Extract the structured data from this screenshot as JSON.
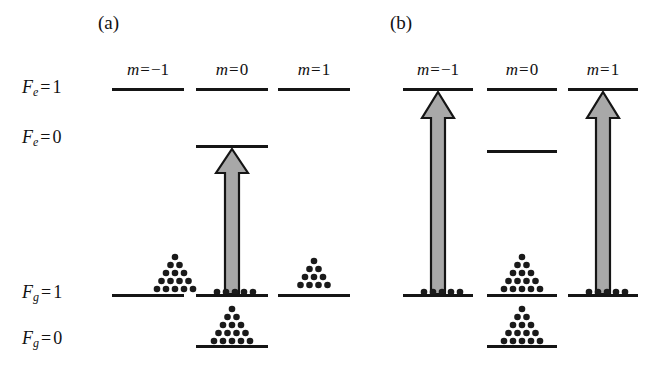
{
  "figure": {
    "width": 666,
    "height": 376,
    "background": "#ffffff",
    "line_color": "#151515",
    "arrow_fill": "#a8a8a8",
    "arrow_stroke": "#151515",
    "dot_color": "#1a1a1a"
  },
  "panels": [
    {
      "id": "a",
      "caption": "(a)",
      "caption_x": 98,
      "caption_y": 12,
      "f_labels": [
        {
          "key": "Fe1",
          "F": "F",
          "sub": "e",
          "eq": "=",
          "num": "1",
          "text": "F_e = 1",
          "x": 22,
          "y": 77
        },
        {
          "key": "Fe0",
          "F": "F",
          "sub": "e",
          "eq": "=",
          "num": "0",
          "text": "F_e = 0",
          "x": 22,
          "y": 127
        },
        {
          "key": "Fg1",
          "F": "F",
          "sub": "g",
          "eq": "=",
          "num": "1",
          "text": "F_g = 1",
          "x": 22,
          "y": 282
        },
        {
          "key": "Fg0",
          "F": "F",
          "sub": "g",
          "eq": "=",
          "num": "0",
          "text": "F_g = 0",
          "x": 22,
          "y": 328
        }
      ],
      "m_labels": [
        {
          "text": "m = -1",
          "m": "m",
          "eq": "=",
          "num": "−1",
          "x": 112,
          "y": 60,
          "width": 72
        },
        {
          "text": "m = 0",
          "m": "m",
          "eq": "=",
          "num": "0",
          "x": 196,
          "y": 60,
          "width": 72
        },
        {
          "text": "m = 1",
          "m": "m",
          "eq": "=",
          "num": "1",
          "x": 278,
          "y": 60,
          "width": 72
        }
      ],
      "levels": [
        {
          "name": "Fe1-m-1",
          "x": 112,
          "y": 88,
          "w": 72
        },
        {
          "name": "Fe1-m0",
          "x": 196,
          "y": 88,
          "w": 72
        },
        {
          "name": "Fe1-m1",
          "x": 278,
          "y": 88,
          "w": 72
        },
        {
          "name": "Fe0-m0",
          "x": 196,
          "y": 145,
          "w": 72
        },
        {
          "name": "Fg1-m-1",
          "x": 112,
          "y": 294,
          "w": 72
        },
        {
          "name": "Fg1-m0",
          "x": 196,
          "y": 294,
          "w": 72
        },
        {
          "name": "Fg1-m1",
          "x": 278,
          "y": 294,
          "w": 72
        },
        {
          "name": "Fg0-m0",
          "x": 196,
          "y": 345,
          "w": 72
        }
      ],
      "arrows": [
        {
          "name": "excitation-arrow-m0",
          "x": 214,
          "y": 147,
          "w": 36,
          "h": 148
        }
      ],
      "dot_clusters": [
        {
          "name": "atom-population-Fg1-m-1",
          "type": "pyramid",
          "rows": 5,
          "x": 148,
          "y": 253
        },
        {
          "name": "atom-population-Fg1-m0",
          "type": "single-row",
          "count": 6,
          "x": 232,
          "y": 287
        },
        {
          "name": "atom-population-Fg1-m1",
          "type": "pyramid",
          "rows": 5,
          "x": 314,
          "y": 257
        },
        {
          "name": "atom-population-Fg0-m0",
          "type": "pyramid",
          "rows": 5,
          "x": 232,
          "y": 305
        }
      ]
    },
    {
      "id": "b",
      "caption": "(b)",
      "caption_x": 390,
      "caption_y": 12,
      "f_labels": [],
      "m_labels": [
        {
          "text": "m = -1",
          "m": "m",
          "eq": "=",
          "num": "−1",
          "x": 403,
          "y": 60,
          "width": 70
        },
        {
          "text": "m = 0",
          "m": "m",
          "eq": "=",
          "num": "0",
          "x": 487,
          "y": 60,
          "width": 70
        },
        {
          "text": "m = 1",
          "m": "m",
          "eq": "=",
          "num": "1",
          "x": 568,
          "y": 60,
          "width": 70
        }
      ],
      "levels": [
        {
          "name": "Fe1-m-1",
          "x": 403,
          "y": 88,
          "w": 70
        },
        {
          "name": "Fe1-m0",
          "x": 487,
          "y": 88,
          "w": 70
        },
        {
          "name": "Fe1-m1",
          "x": 568,
          "y": 88,
          "w": 70
        },
        {
          "name": "Fe0-m0",
          "x": 487,
          "y": 150,
          "w": 70
        },
        {
          "name": "Fg1-m-1",
          "x": 403,
          "y": 294,
          "w": 70
        },
        {
          "name": "Fg1-m0",
          "x": 487,
          "y": 294,
          "w": 70
        },
        {
          "name": "Fg1-m1",
          "x": 568,
          "y": 294,
          "w": 70
        },
        {
          "name": "Fg0-m0",
          "x": 487,
          "y": 345,
          "w": 70
        }
      ],
      "arrows": [
        {
          "name": "excitation-arrow-m-1",
          "x": 420,
          "y": 90,
          "w": 36,
          "h": 205
        },
        {
          "name": "excitation-arrow-m1",
          "x": 585,
          "y": 90,
          "w": 36,
          "h": 205
        }
      ],
      "dot_clusters": [
        {
          "name": "atom-population-Fg1-m-1",
          "type": "single-row",
          "count": 6,
          "x": 420,
          "y": 287
        },
        {
          "name": "atom-population-Fg1-m0",
          "type": "pyramid",
          "rows": 5,
          "x": 505,
          "y": 253
        },
        {
          "name": "atom-population-Fg1-m1",
          "type": "single-row",
          "count": 6,
          "x": 585,
          "y": 287
        },
        {
          "name": "atom-population-Fg0-m0",
          "type": "pyramid",
          "rows": 5,
          "x": 505,
          "y": 305
        }
      ]
    }
  ],
  "diagram_meta": {
    "type": "energy-level-diagram",
    "description": "Atomic hyperfine energy level diagram showing Zeeman sublevels m = -1, 0, 1 for F_e = 1 and F_g = 1 manifolds, plus F_e = 0 and F_g = 0 levels, with optical pumping excitation arrows and atomic population dot clusters.",
    "pyramid_rows": [
      1,
      2,
      3,
      4,
      5
    ],
    "dot_radius": 3.2,
    "dot_spacing_x": 9,
    "dot_spacing_y": 8
  }
}
